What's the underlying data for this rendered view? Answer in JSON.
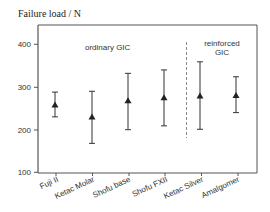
{
  "chart_data": {
    "type": "scatter",
    "subtype": "mean-with-error-bars",
    "title": "",
    "ylabel": "Failure load / N",
    "xlabel": "",
    "ylim": [
      100,
      450
    ],
    "yticks": [
      100,
      200,
      300,
      400
    ],
    "grid": false,
    "legend": null,
    "marker": "triangle",
    "categories": [
      "Fuji II",
      "Ketac Molar",
      "Shofu base",
      "Shofu FXII",
      "Ketac Silver",
      "Amalgomer"
    ],
    "series": [
      {
        "name": "Failure load",
        "mean": [
          258,
          230,
          268,
          275,
          279,
          280
        ],
        "upper": [
          288,
          290,
          332,
          340,
          359,
          324
        ],
        "lower": [
          230,
          168,
          200,
          209,
          201,
          240
        ]
      }
    ],
    "annotations": [
      {
        "text": "ordinary GIC",
        "group": [
          "Fuji II",
          "Ketac Molar",
          "Shofu base",
          "Shofu FXII"
        ]
      },
      {
        "text": "reinforced GIC",
        "group": [
          "Ketac Silver",
          "Amalgomer"
        ]
      }
    ],
    "separator": {
      "style": "dashed",
      "between": [
        "Shofu FXII",
        "Ketac Silver"
      ]
    }
  },
  "labels": {
    "ylabel": "Failure load / N",
    "ordinary": "ordinary GIC",
    "reinforced_line1": "reinforced",
    "reinforced_line2": "GIC",
    "yticks": [
      "100",
      "200",
      "300",
      "400"
    ],
    "categories": [
      "Fuji II",
      "Ketac Molar",
      "Shofu base",
      "Shofu FXII",
      "Ketac Silver",
      "Amalgomer"
    ]
  }
}
